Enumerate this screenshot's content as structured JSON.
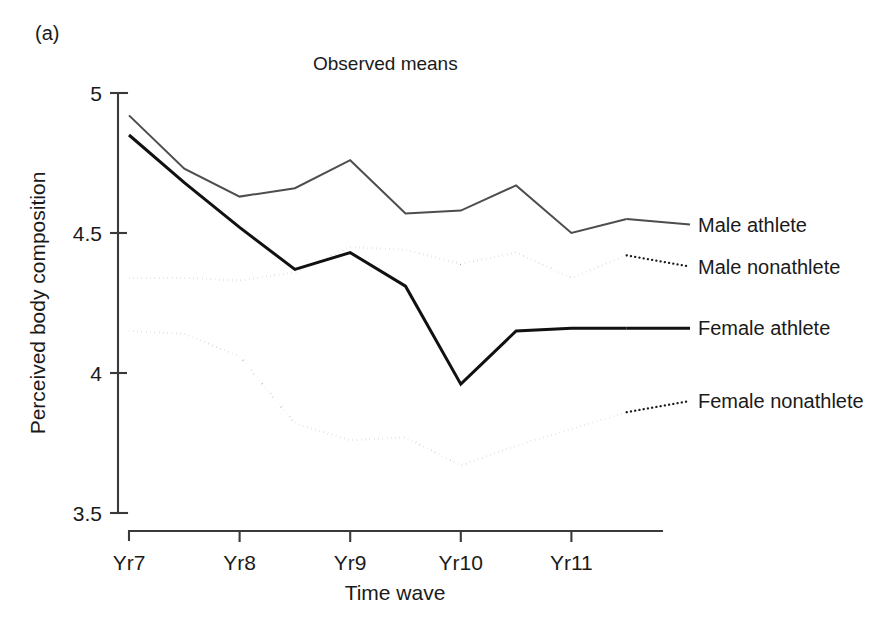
{
  "figure": {
    "panel_label": "(a)",
    "title": "Observed means"
  },
  "chart_data": {
    "type": "line",
    "title": "Observed means",
    "xlabel": "Time wave",
    "ylabel": "Perceived body composition",
    "xlim": [
      7.0,
      11.8
    ],
    "ylim": [
      3.5,
      5.0
    ],
    "yticks": [
      5,
      4.5,
      4,
      3.5
    ],
    "ytick_labels": [
      "5",
      "4.5",
      "4",
      "3.5"
    ],
    "xticks": [
      7,
      8,
      9,
      10,
      11
    ],
    "xtick_labels": [
      "Yr7",
      "Yr8",
      "Yr9",
      "Yr10",
      "Yr11"
    ],
    "grid": false,
    "legend_position": "right-inline-labels",
    "x": [
      7.0,
      7.5,
      8.0,
      8.5,
      9.0,
      9.5,
      10.0,
      10.5,
      11.0,
      11.5
    ],
    "series": [
      {
        "name": "Male athlete",
        "style": "solid",
        "color": "#4d4d4d",
        "width": 2.0,
        "values": [
          4.92,
          4.73,
          4.63,
          4.66,
          4.76,
          4.57,
          4.58,
          4.67,
          4.5,
          4.55
        ],
        "label_y": 4.53
      },
      {
        "name": "Male nonathlete",
        "style": "dotted",
        "color": "#1a1a1a",
        "width": 2.3,
        "values": [
          4.34,
          4.34,
          4.33,
          4.36,
          4.45,
          4.44,
          4.39,
          4.43,
          4.34,
          4.42
        ],
        "label_y": 4.38
      },
      {
        "name": "Female athlete",
        "style": "solid",
        "color": "#111111",
        "width": 3.0,
        "values": [
          4.85,
          4.68,
          4.52,
          4.37,
          4.43,
          4.31,
          3.96,
          4.15,
          4.16,
          4.16
        ],
        "label_y": 4.16
      },
      {
        "name": "Female nonathlete",
        "style": "dotted",
        "color": "#1a1a1a",
        "width": 2.3,
        "values": [
          4.15,
          4.14,
          4.06,
          3.82,
          3.76,
          3.77,
          3.67,
          3.74,
          3.8,
          3.86
        ],
        "label_y": 3.9
      }
    ]
  }
}
